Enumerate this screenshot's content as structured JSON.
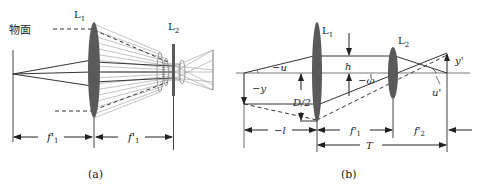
{
  "figure_a": {
    "caption": "(a)",
    "object_plane_label": "物面",
    "lens1_label": "L",
    "lens1_sub": "1",
    "lens2_label": "L",
    "lens2_sub": "2",
    "dim_left_label": "f'",
    "dim_left_sub": "1",
    "dim_right_label": "f'",
    "dim_right_sub": "1"
  },
  "figure_b": {
    "caption": "(b)",
    "lens1_label": "L",
    "lens1_sub": "1",
    "lens2_label": "L",
    "lens2_sub": "2",
    "angle_u": "−u",
    "object_height": "−y",
    "aperture_half": "D/2",
    "ray_height": "h",
    "field_angle": "−ω",
    "image_height": "y'",
    "image_angle": "u'",
    "dim_object_distance": "−l",
    "dim_f1": "f'",
    "dim_f1_sub": "1",
    "dim_f2": "f'",
    "dim_f2_sub": "2",
    "dim_total": "T"
  },
  "colors": {
    "lens_fill": "#5a5a5a",
    "line": "#333333",
    "ray_light": "#9a9a9a"
  }
}
